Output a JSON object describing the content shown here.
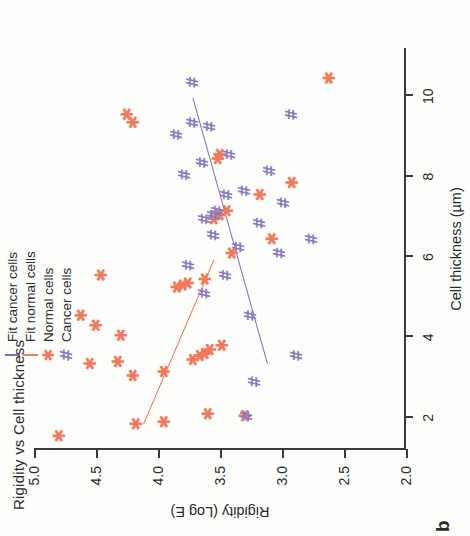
{
  "panel_label": "b",
  "legend": {
    "items": [
      {
        "label": "Fit cancer cells",
        "key": "line",
        "color": "#7c6fb8"
      },
      {
        "label": "Fit normal cells",
        "key": "line",
        "color": "#f4785a"
      },
      {
        "label": "Normal cells",
        "key": "asterisk-marker",
        "glyph": "✱",
        "color": "#f4785a"
      },
      {
        "label": "Cancer cells",
        "key": "hash-marker",
        "glyph": "#",
        "color": "#8a7cc2"
      }
    ]
  },
  "chart_data": {
    "type": "scatter",
    "title": "Rigidity vs Cell thickness",
    "xlabel": "Cell thickness (µm)",
    "ylabel": "Rigidity (Log E)",
    "xlim": [
      1.2,
      11.2
    ],
    "ylim": [
      2.0,
      5.0
    ],
    "xticks": [
      2,
      4,
      6,
      8,
      10
    ],
    "xticklabels": [
      "2",
      "4",
      "6",
      "8",
      "10"
    ],
    "yticks": [
      2.0,
      2.5,
      3.0,
      3.5,
      4.0,
      4.5,
      5.0
    ],
    "yticklabels": [
      "2.0",
      "2.5",
      "3.0",
      "3.5",
      "4.0",
      "4.5",
      "5.0"
    ],
    "grid": false,
    "legend_position": "top-left",
    "series": [
      {
        "name": "Normal cells",
        "marker": "asterisk",
        "color": "#f4785a",
        "points": [
          [
            1.55,
            4.8
          ],
          [
            1.85,
            4.18
          ],
          [
            1.9,
            3.95
          ],
          [
            2.1,
            3.6
          ],
          [
            2.05,
            3.3
          ],
          [
            3.05,
            4.2
          ],
          [
            3.15,
            3.95
          ],
          [
            3.35,
            4.55
          ],
          [
            3.4,
            4.32
          ],
          [
            3.45,
            3.72
          ],
          [
            3.55,
            3.66
          ],
          [
            3.6,
            3.62
          ],
          [
            3.7,
            3.58
          ],
          [
            3.8,
            3.48
          ],
          [
            4.05,
            4.3
          ],
          [
            4.3,
            4.5
          ],
          [
            4.55,
            4.62
          ],
          [
            5.25,
            3.85
          ],
          [
            5.3,
            3.8
          ],
          [
            5.35,
            3.76
          ],
          [
            5.45,
            3.62
          ],
          [
            5.55,
            4.46
          ],
          [
            6.1,
            3.4
          ],
          [
            6.45,
            3.08
          ],
          [
            6.95,
            3.55
          ],
          [
            7.05,
            3.5
          ],
          [
            7.15,
            3.44
          ],
          [
            7.55,
            3.18
          ],
          [
            7.85,
            2.92
          ],
          [
            8.45,
            3.52
          ],
          [
            8.55,
            3.5
          ],
          [
            9.35,
            4.2
          ],
          [
            9.55,
            4.25
          ],
          [
            10.45,
            2.62
          ]
        ]
      },
      {
        "name": "Cancer cells",
        "marker": "hash",
        "color": "#8a7cc2",
        "points": [
          [
            2.05,
            3.28
          ],
          [
            2.9,
            3.22
          ],
          [
            3.55,
            2.88
          ],
          [
            4.55,
            3.25
          ],
          [
            5.1,
            3.62
          ],
          [
            5.55,
            3.45
          ],
          [
            5.8,
            3.75
          ],
          [
            6.1,
            3.02
          ],
          [
            6.25,
            3.35
          ],
          [
            6.45,
            2.76
          ],
          [
            6.55,
            3.55
          ],
          [
            6.85,
            3.18
          ],
          [
            6.95,
            3.62
          ],
          [
            7.05,
            3.55
          ],
          [
            7.15,
            3.52
          ],
          [
            7.35,
            2.98
          ],
          [
            7.55,
            3.44
          ],
          [
            7.65,
            3.3
          ],
          [
            8.05,
            3.78
          ],
          [
            8.15,
            3.1
          ],
          [
            8.35,
            3.64
          ],
          [
            8.55,
            3.42
          ],
          [
            9.05,
            3.85
          ],
          [
            9.25,
            3.58
          ],
          [
            9.35,
            3.72
          ],
          [
            9.55,
            2.92
          ],
          [
            10.35,
            3.72
          ]
        ]
      }
    ],
    "fits": [
      {
        "name": "Fit normal cells",
        "color": "#f4785a",
        "x0": 1.85,
        "y0": 4.12,
        "x1": 5.95,
        "y1": 3.55
      },
      {
        "name": "Fit cancer cells",
        "color": "#7c6fb8",
        "x0": 3.35,
        "y0": 3.12,
        "x1": 9.95,
        "y1": 3.72
      }
    ]
  }
}
